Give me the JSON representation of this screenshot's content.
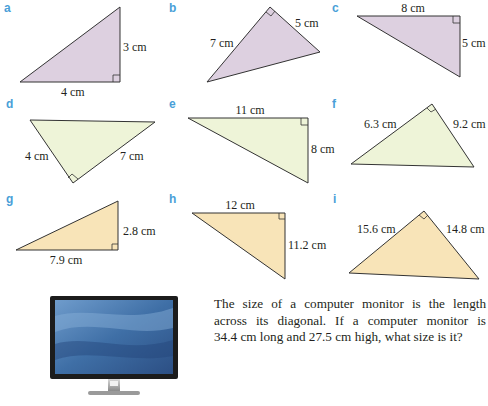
{
  "colors": {
    "letter": "#4a9fd8",
    "fill_row1": "#ddd0e0",
    "fill_row2": "#eef4d8",
    "fill_row3": "#f8e4b8",
    "stroke": "#333333"
  },
  "triangles": [
    {
      "letter": "a",
      "labels": [
        "3 cm",
        "4 cm"
      ],
      "right_angle": true
    },
    {
      "letter": "b",
      "labels": [
        "7 cm",
        "5 cm"
      ],
      "right_angle": true
    },
    {
      "letter": "c",
      "labels": [
        "8 cm",
        "5 cm"
      ],
      "right_angle": true
    },
    {
      "letter": "d",
      "labels": [
        "4 cm",
        "7 cm"
      ],
      "right_angle": true
    },
    {
      "letter": "e",
      "labels": [
        "11 cm",
        "8 cm"
      ],
      "right_angle": true
    },
    {
      "letter": "f",
      "labels": [
        "6.3 cm",
        "9.2 cm"
      ],
      "right_angle": true
    },
    {
      "letter": "g",
      "labels": [
        "2.8 cm",
        "7.9 cm"
      ],
      "right_angle": true
    },
    {
      "letter": "h",
      "labels": [
        "12 cm",
        "11.2 cm"
      ],
      "right_angle": true
    },
    {
      "letter": "i",
      "labels": [
        "15.6 cm",
        "14.8 cm"
      ],
      "right_angle": true
    }
  ],
  "problem": {
    "line1": "The size of a computer monitor is the length",
    "line2": "across its diagonal.  If a computer monitor is",
    "line3": "34.4 cm long and 27.5 cm high, what size is it?"
  },
  "image": {
    "subject": "computer-monitor"
  }
}
